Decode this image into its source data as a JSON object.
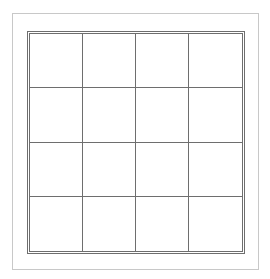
{
  "grid": {
    "rows": 4,
    "columns": 4,
    "line_color": "#6e6e6e",
    "frame_color": "#c8c8c8"
  }
}
